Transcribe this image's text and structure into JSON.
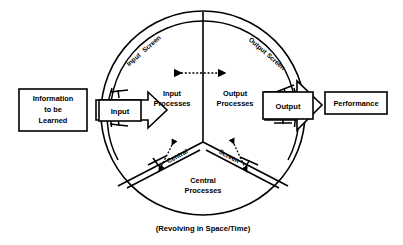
{
  "diagram": {
    "title_caption": "(Revolving in Space/Time)",
    "boxes": {
      "source": {
        "line1": "Information",
        "line2": "to be",
        "line3": "Learned"
      },
      "input": {
        "label": "Input"
      },
      "output": {
        "label": "Output"
      },
      "performance": {
        "label": "Performance"
      }
    },
    "processes": {
      "input": {
        "line1": "Input",
        "line2": "Processes"
      },
      "output": {
        "line1": "Output",
        "line2": "Processes"
      },
      "central": {
        "line1": "Central",
        "line2": "Processes"
      }
    },
    "screens": {
      "input": {
        "word1": "Input",
        "word2": "Screen"
      },
      "output": {
        "word1": "Output",
        "word2": "Screen"
      },
      "central": {
        "word1": "Central",
        "word2": "Screen"
      }
    },
    "colors": {
      "stroke": "#000000",
      "background": "#ffffff",
      "text": "#000000"
    },
    "geometry": {
      "circle_center_x": 203,
      "circle_center_y": 113,
      "outer_radius": 102,
      "inner_radius": 92
    }
  }
}
